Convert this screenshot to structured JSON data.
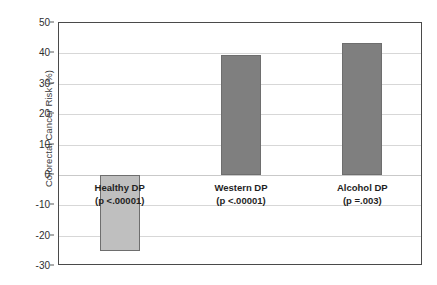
{
  "chart_data": {
    "type": "bar",
    "title": "",
    "xlabel": "",
    "ylabel": "Colorectal Cancer Risk (%)",
    "ylim": [
      -30,
      50
    ],
    "yticks": [
      50,
      40,
      30,
      20,
      10,
      0,
      -10,
      -20,
      -30
    ],
    "ytick_labels": [
      "50",
      "40",
      "30",
      "20",
      "10",
      "0",
      "-10",
      "-20",
      "-30"
    ],
    "grid": true,
    "legend": "none",
    "categories": [
      "Healthy DP",
      "Western DP",
      "Alcohol DP"
    ],
    "values": [
      -25,
      39.5,
      43.5
    ],
    "annotations": [
      "(p <.00001)",
      "(p <.00001)",
      "(p =.003)"
    ],
    "bars": [
      {
        "category": "Healthy DP",
        "pvalue_label": "(p <.00001)",
        "value": -25,
        "color": "#bfbfbf"
      },
      {
        "category": "Western DP",
        "pvalue_label": "(p <.00001)",
        "value": 39.5,
        "color": "#7f7f7f"
      },
      {
        "category": "Alcohol DP",
        "pvalue_label": "(p =.003)",
        "value": 43.5,
        "color": "#7f7f7f"
      }
    ],
    "colors": {
      "bar_light": "#bfbfbf",
      "bar_dark": "#7f7f7f",
      "bar_edge": "#6e6e6e",
      "gridline": "#d7d7d7",
      "axis_border": "#4a4a4a",
      "tick_text": "#2e2e2e",
      "label_text": "#1f1f1f",
      "background": "#ffffff"
    }
  }
}
